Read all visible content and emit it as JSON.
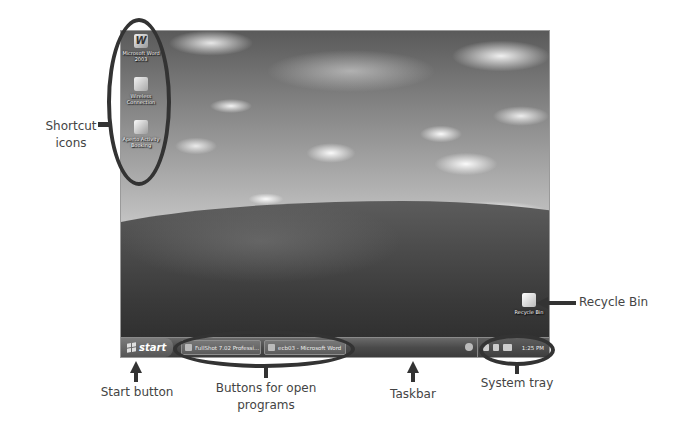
{
  "desktop": {
    "wallpaper": "bliss-grayscale",
    "icons": [
      {
        "name": "microsoft-word-2003",
        "label": "Microsoft Word 2003",
        "icon": "word-icon"
      },
      {
        "name": "wireless-connection",
        "label": "Wireless Connection",
        "icon": "network-wizard-icon"
      },
      {
        "name": "aperto-activity-booking",
        "label": "Aperto Activity Booking",
        "icon": "document-icon"
      }
    ],
    "recycle_bin": {
      "label": "Recycle Bin",
      "icon": "recycle-bin-icon"
    }
  },
  "taskbar": {
    "start_label": "start",
    "buttons": [
      {
        "label": "FullShot 7.02 Professi...",
        "icon": "fullshot-icon"
      },
      {
        "label": "ecb03 - Microsoft Word",
        "icon": "word-icon"
      }
    ],
    "tray": {
      "icons": [
        "speaker-icon",
        "network-icon",
        "safely-remove-icon"
      ],
      "clock": "1:25 PM"
    }
  },
  "callouts": {
    "shortcut_icons": "Shortcut icons",
    "recycle_bin": "Recycle Bin",
    "start_button": "Start button",
    "open_programs": "Buttons for open programs",
    "taskbar": "Taskbar",
    "system_tray": "System tray"
  },
  "colors": {
    "annotation": "#333333",
    "callout_text": "#444444",
    "taskbar": "#4a4a4a"
  }
}
